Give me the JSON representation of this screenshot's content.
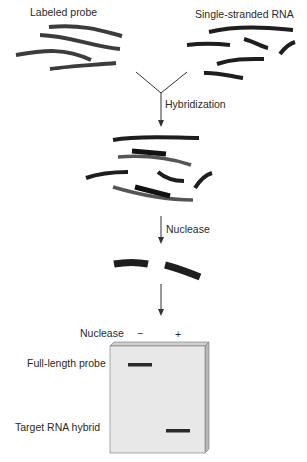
{
  "labels": {
    "labeled_probe": "Labeled probe",
    "single_stranded_rna": "Single-stranded RNA",
    "hybridization": "Hybridization",
    "nuclease_step": "Nuclease",
    "gel_nuclease": "Nuclease",
    "minus": "−",
    "plus": "+",
    "full_length_probe": "Full-length probe",
    "target_rna_hybrid": "Target RNA hybrid"
  },
  "colors": {
    "probe_strand": "#3a3a3a",
    "rna_strand": "#1e1e1e",
    "gel_face": "#e6e6e6",
    "gel_edge": "#bdbdbd",
    "band": "#2a2a2a",
    "arrow": "#333333"
  }
}
